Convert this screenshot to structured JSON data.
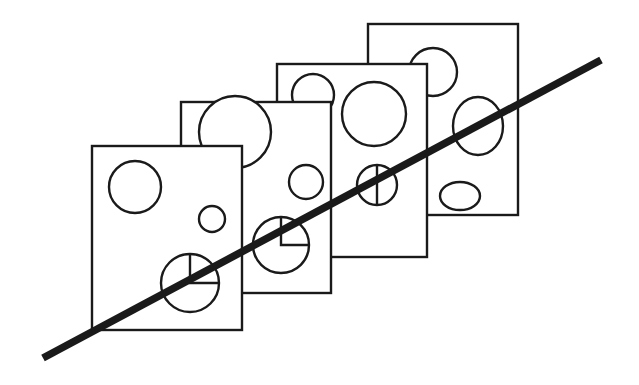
{
  "figure": {
    "canvas": {
      "width": 639,
      "height": 385,
      "background": "#ffffff"
    },
    "ink_color": "#1a1a1a",
    "stroke_widths": {
      "outline": 2.4,
      "hole": 2.4,
      "marker": 2.4,
      "diagonal": 7.5
    },
    "plates": [
      {
        "id": "plate-4",
        "label": "back-plate",
        "depth_order": 1,
        "x": 368,
        "y": 24,
        "width": 150,
        "height": 191,
        "holes": [
          {
            "id": "hole-4-top",
            "shape": "circle",
            "cx": 433,
            "cy": 72,
            "rx": 24,
            "ry": 24,
            "marker": "none"
          },
          {
            "id": "hole-4-mid",
            "shape": "ellipse",
            "cx": 478,
            "cy": 126,
            "rx": 25,
            "ry": 29,
            "marker": "none"
          },
          {
            "id": "hole-4-low",
            "shape": "ellipse",
            "cx": 460,
            "cy": 196,
            "rx": 20,
            "ry": 14,
            "marker": "none"
          }
        ]
      },
      {
        "id": "plate-3",
        "label": "third-plate",
        "depth_order": 2,
        "x": 277,
        "y": 64,
        "width": 150,
        "height": 193,
        "holes": [
          {
            "id": "hole-3-top",
            "shape": "circle",
            "cx": 313,
            "cy": 95,
            "rx": 21,
            "ry": 21,
            "marker": "none"
          },
          {
            "id": "hole-3-big",
            "shape": "circle",
            "cx": 374,
            "cy": 114,
            "rx": 32,
            "ry": 32,
            "marker": "none"
          },
          {
            "id": "hole-3-marked",
            "shape": "circle",
            "cx": 377,
            "cy": 185,
            "rx": 20,
            "ry": 20,
            "marker": "vertical-diameter"
          }
        ]
      },
      {
        "id": "plate-2",
        "label": "second-plate",
        "depth_order": 3,
        "x": 181,
        "y": 102,
        "width": 150,
        "height": 191,
        "holes": [
          {
            "id": "hole-2-big",
            "shape": "circle",
            "cx": 235,
            "cy": 132,
            "rx": 36,
            "ry": 36,
            "marker": "none"
          },
          {
            "id": "hole-2-small",
            "shape": "circle",
            "cx": 306,
            "cy": 182,
            "rx": 17,
            "ry": 17,
            "marker": "none"
          },
          {
            "id": "hole-2-marked",
            "shape": "circle",
            "cx": 281,
            "cy": 245,
            "rx": 28,
            "ry": 28,
            "marker": "quadrant-corner"
          }
        ]
      },
      {
        "id": "plate-1",
        "label": "front-plate",
        "depth_order": 4,
        "x": 92,
        "y": 146,
        "width": 150,
        "height": 184,
        "holes": [
          {
            "id": "hole-1-big",
            "shape": "circle",
            "cx": 135,
            "cy": 187,
            "rx": 26,
            "ry": 26,
            "marker": "none"
          },
          {
            "id": "hole-1-small",
            "shape": "circle",
            "cx": 212,
            "cy": 219,
            "rx": 13,
            "ry": 13,
            "marker": "none"
          },
          {
            "id": "hole-1-marked",
            "shape": "circle",
            "cx": 190,
            "cy": 283,
            "rx": 29,
            "ry": 29,
            "marker": "quadrant-corner"
          }
        ]
      }
    ],
    "diagonal": {
      "id": "diagonal-line",
      "x1": 43,
      "y1": 358,
      "x2": 601,
      "y2": 60,
      "width": 7.5
    }
  }
}
